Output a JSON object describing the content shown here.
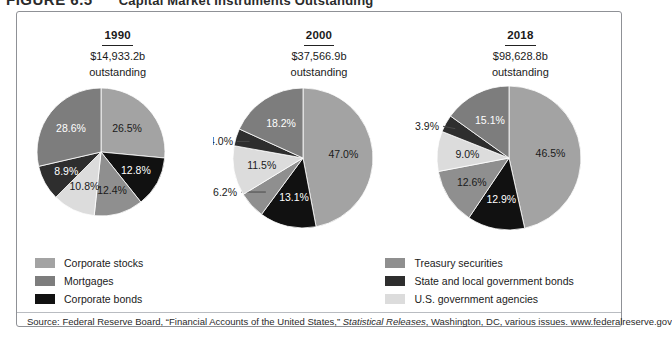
{
  "figure": {
    "number": "FIGURE 6.5",
    "caption": "Capital Market Instruments Outstanding"
  },
  "headers": [
    {
      "year": "1990",
      "amount": "$14,933.2b",
      "outstanding": "outstanding"
    },
    {
      "year": "2000",
      "amount": "$37,566.9b",
      "outstanding": "outstanding"
    },
    {
      "year": "2018",
      "amount": "$98,628.8b",
      "outstanding": "outstanding"
    }
  ],
  "legend": {
    "columns": [
      {
        "items": [
          {
            "label": "Corporate stocks",
            "color": "#a3a3a3"
          },
          {
            "label": "Mortgages",
            "color": "#7d7d7d"
          },
          {
            "label": "Corporate bonds",
            "color": "#111111"
          }
        ]
      },
      {
        "items": [
          {
            "label": "Treasury securities",
            "color": "#8f8f8f"
          },
          {
            "label": "State and local government bonds",
            "color": "#2e2e2e"
          },
          {
            "label": "U.S. government agencies",
            "color": "#dcdcdc"
          }
        ]
      }
    ]
  },
  "source": {
    "prefix": "Source: Federal Reserve Board, “Financial Accounts of the United States,” ",
    "italic": "Statistical Releases",
    "suffix": ", Washington, DC, various issues. www.federalreserve.gov"
  },
  "chart_data": [
    {
      "type": "pie",
      "title": "1990",
      "subtitle": "$14,933.2b outstanding",
      "total": "14933.2",
      "categories": [
        "Corporate stocks",
        "Corporate bonds",
        "Treasury securities",
        "U.S. government agencies",
        "State and local government bonds",
        "Mortgages"
      ],
      "values": [
        26.5,
        12.8,
        12.4,
        10.8,
        8.9,
        28.6
      ],
      "labels": [
        "26.5%",
        "12.8%",
        "12.4%",
        "10.8%",
        "8.9%",
        "28.6%"
      ],
      "colors": [
        "#a3a3a3",
        "#111111",
        "#8f8f8f",
        "#dcdcdc",
        "#2e2e2e",
        "#7d7d7d"
      ],
      "label_colors": [
        "dark",
        "light",
        "dark",
        "dark",
        "light",
        "light"
      ],
      "leaders": [
        false,
        false,
        false,
        false,
        false,
        false
      ]
    },
    {
      "type": "pie",
      "title": "2000",
      "subtitle": "$37,566.9b outstanding",
      "total": "37566.9",
      "categories": [
        "Corporate stocks",
        "Corporate bonds",
        "Treasury securities",
        "U.S. government agencies",
        "State and local government bonds",
        "Mortgages"
      ],
      "values": [
        47.0,
        13.1,
        6.2,
        11.5,
        4.0,
        18.2
      ],
      "labels": [
        "47.0%",
        "13.1%",
        "6.2%",
        "11.5%",
        "4.0%",
        "18.2%"
      ],
      "colors": [
        "#a3a3a3",
        "#111111",
        "#8f8f8f",
        "#dcdcdc",
        "#2e2e2e",
        "#7d7d7d"
      ],
      "label_colors": [
        "dark",
        "light",
        "dark",
        "dark",
        "dark",
        "light"
      ],
      "leaders": [
        false,
        false,
        true,
        false,
        true,
        false
      ]
    },
    {
      "type": "pie",
      "title": "2018",
      "subtitle": "$98,628.8b outstanding",
      "total": "98628.8",
      "categories": [
        "Corporate stocks",
        "Corporate bonds",
        "Treasury securities",
        "U.S. government agencies",
        "State and local government bonds",
        "Mortgages"
      ],
      "values": [
        46.5,
        12.9,
        12.6,
        9.0,
        3.9,
        15.1
      ],
      "labels": [
        "46.5%",
        "12.9%",
        "12.6%",
        "9.0%",
        "3.9%",
        "15.1%"
      ],
      "colors": [
        "#a3a3a3",
        "#111111",
        "#8f8f8f",
        "#dcdcdc",
        "#2e2e2e",
        "#7d7d7d"
      ],
      "label_colors": [
        "dark",
        "light",
        "dark",
        "dark",
        "dark",
        "light"
      ],
      "leaders": [
        false,
        false,
        false,
        false,
        true,
        false
      ]
    }
  ]
}
